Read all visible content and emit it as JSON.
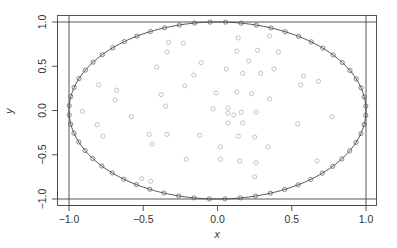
{
  "chart_data": {
    "type": "scatter",
    "title": "",
    "xlabel": "x",
    "ylabel": "y",
    "xlim": [
      -1.08,
      1.08
    ],
    "ylim": [
      -1.08,
      1.08
    ],
    "grid": false,
    "legend": null,
    "x_ticks": [
      -1.0,
      -0.5,
      0.0,
      0.5,
      1.0
    ],
    "x_tick_labels": [
      "-1.0",
      "-0.5",
      "0.0",
      "0.5",
      "1.0"
    ],
    "y_ticks": [
      -1.0,
      -0.5,
      0.0,
      0.5,
      1.0
    ],
    "y_tick_labels": [
      "-1.0",
      "-0.5",
      "0.0",
      "0.5",
      "1.0"
    ],
    "reference_lines": {
      "vertical": [
        -1.0,
        1.0
      ],
      "horizontal": [
        -1.0,
        1.0
      ]
    },
    "curve": {
      "name": "unit circle",
      "type": "line",
      "description": "x^2 + y^2 = 1"
    },
    "series": [
      {
        "name": "boundary points",
        "marker": "open-circle",
        "color": "#555555",
        "count": 60,
        "description": "points lying on the unit circle"
      },
      {
        "name": "interior points",
        "marker": "open-circle",
        "color": "#aaaaaa",
        "points": [
          [
            -0.33,
            0.77
          ],
          [
            -0.23,
            0.76
          ],
          [
            -0.34,
            0.66
          ],
          [
            -0.41,
            0.49
          ],
          [
            -0.11,
            0.54
          ],
          [
            -0.16,
            0.4
          ],
          [
            -0.22,
            0.28
          ],
          [
            -0.01,
            0.2
          ],
          [
            -0.8,
            0.29
          ],
          [
            -0.68,
            0.23
          ],
          [
            -0.69,
            0.12
          ],
          [
            -0.38,
            0.18
          ],
          [
            -0.35,
            0.05
          ],
          [
            -0.03,
            0.02
          ],
          [
            -0.91,
            -0.01
          ],
          [
            0.14,
            0.82
          ],
          [
            0.35,
            0.84
          ],
          [
            0.13,
            0.67
          ],
          [
            0.27,
            0.68
          ],
          [
            0.41,
            0.66
          ],
          [
            0.21,
            0.56
          ],
          [
            0.06,
            0.47
          ],
          [
            0.17,
            0.42
          ],
          [
            0.29,
            0.42
          ],
          [
            0.38,
            0.47
          ],
          [
            0.58,
            0.39
          ],
          [
            0.68,
            0.33
          ],
          [
            0.56,
            0.29
          ],
          [
            0.13,
            0.21
          ],
          [
            0.35,
            0.13
          ],
          [
            0.07,
            0.03
          ],
          [
            0.16,
            -0.02
          ],
          [
            0.23,
            0.19
          ],
          [
            0.26,
            -0.02
          ],
          [
            -0.81,
            -0.16
          ],
          [
            -0.77,
            -0.29
          ],
          [
            -0.58,
            -0.07
          ],
          [
            -0.46,
            -0.27
          ],
          [
            -0.44,
            -0.38
          ],
          [
            -0.34,
            -0.27
          ],
          [
            -0.12,
            -0.28
          ],
          [
            -0.21,
            -0.55
          ],
          [
            -0.51,
            -0.77
          ],
          [
            -0.45,
            -0.8
          ],
          [
            0.11,
            -0.05
          ],
          [
            0.07,
            -0.03
          ],
          [
            0.17,
            -0.14
          ],
          [
            0.07,
            -0.14
          ],
          [
            0.14,
            -0.29
          ],
          [
            0.25,
            -0.3
          ],
          [
            0.34,
            -0.41
          ],
          [
            0.02,
            -0.41
          ],
          [
            0.02,
            -0.55
          ],
          [
            0.15,
            -0.57
          ],
          [
            0.26,
            -0.59
          ],
          [
            0.25,
            -0.75
          ],
          [
            0.77,
            -0.07
          ],
          [
            0.54,
            -0.15
          ],
          [
            0.67,
            -0.57
          ]
        ]
      }
    ]
  },
  "axes": {
    "xlabel": "x",
    "ylabel": "y"
  }
}
